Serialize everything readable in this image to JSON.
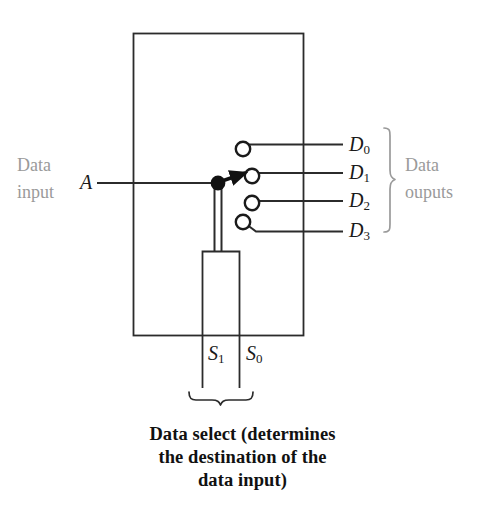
{
  "figure": {
    "type": "demultiplexer-switch-diagram",
    "stroke_color": "#2b2b2b",
    "note_color": "#9a9a9a",
    "label_color": "#1a1a1a"
  },
  "input": {
    "note_line1": "Data",
    "note_line2": "input",
    "signal": "A"
  },
  "outputs": {
    "note_line1": "Data",
    "note_line2": "ouputs",
    "items": [
      {
        "base": "D",
        "sub": "0"
      },
      {
        "base": "D",
        "sub": "1"
      },
      {
        "base": "D",
        "sub": "2"
      },
      {
        "base": "D",
        "sub": "3"
      }
    ]
  },
  "select": {
    "lines": [
      {
        "base": "S",
        "sub": "1"
      },
      {
        "base": "S",
        "sub": "0"
      }
    ]
  },
  "caption": {
    "line1": "Data select (determines",
    "line2": "the destination of the",
    "line3": "data input)"
  }
}
